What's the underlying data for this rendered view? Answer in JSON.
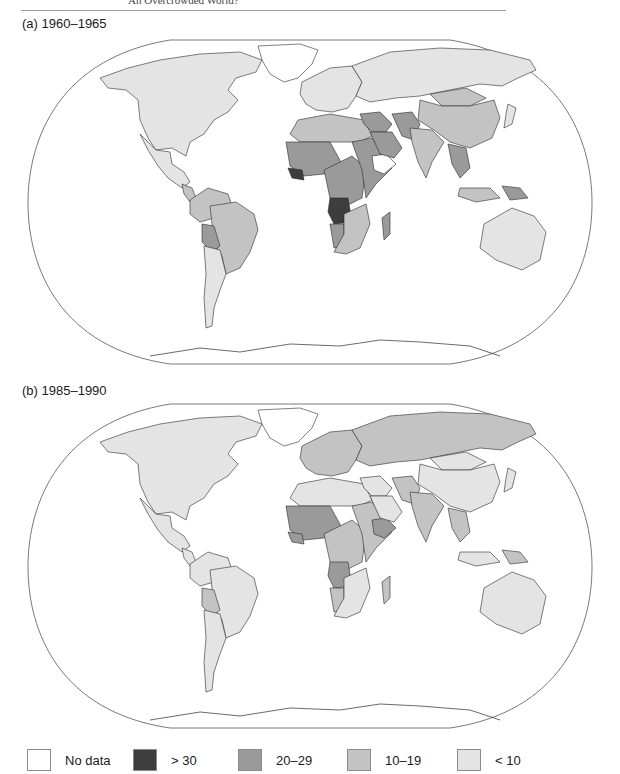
{
  "page": {
    "running_head": "An Overcrowded World?",
    "caption_a": "(a) 1960–1965",
    "caption_b": "(b) 1985–1990"
  },
  "colors": {
    "no_data": "#ffffff",
    "gt30": "#3d3d3d",
    "r20_29": "#9a9a9a",
    "r10_19": "#c3c3c3",
    "lt10": "#e4e4e4"
  },
  "legend": [
    {
      "label": "No data",
      "class": "no_data"
    },
    {
      "label": "> 30",
      "class": "gt30"
    },
    {
      "label": "20–29",
      "class": "r20_29"
    },
    {
      "label": "10–19",
      "class": "r10_19"
    },
    {
      "label": "< 10",
      "class": "lt10"
    }
  ],
  "chart_data": [
    {
      "type": "heatmap",
      "subtype": "choropleth-world-map",
      "title": "(a) 1960–1965",
      "legend": [
        "No data",
        "> 30",
        "20–29",
        "10–19",
        "< 10"
      ],
      "regions": {
        "north_america": "lt10",
        "greenland": "no_data",
        "mexico_central_america": "lt10",
        "central_america_south": "r10_19",
        "south_america_north": "r10_19",
        "brazil": "r10_19",
        "bolivia": "r20_29",
        "argentina": "lt10",
        "europe": "lt10",
        "soviet_union": "lt10",
        "north_africa": "r10_19",
        "west_africa_sahel": "r20_29",
        "sierra_leone_guinea": "gt30",
        "central_africa": "r20_29",
        "east_africa": "r20_29",
        "angola": "gt30",
        "southern_africa": "r10_19",
        "namibia": "r20_29",
        "madagascar": "r20_29",
        "middle_east": "r20_29",
        "arabia": "r20_29",
        "afghanistan_pakistan": "r20_29",
        "india": "r10_19",
        "china": "r10_19",
        "mongolia": "r10_19",
        "southeast_asia": "r20_29",
        "indonesia": "r10_19",
        "new_guinea": "r20_29",
        "australia": "lt10",
        "japan": "lt10"
      }
    },
    {
      "type": "heatmap",
      "subtype": "choropleth-world-map",
      "title": "(b) 1985–1990",
      "legend": [
        "No data",
        "> 30",
        "20–29",
        "10–19",
        "< 10"
      ],
      "regions": {
        "north_america": "lt10",
        "greenland": "no_data",
        "mexico_central_america": "lt10",
        "central_america_south": "lt10",
        "south_america_north": "lt10",
        "brazil": "lt10",
        "bolivia": "r10_19",
        "argentina": "lt10",
        "europe": "r10_19",
        "soviet_union": "r10_19",
        "north_africa": "lt10",
        "west_africa_sahel": "r20_29",
        "sierra_leone_guinea": "r20_29",
        "central_africa": "r10_19",
        "east_africa": "r10_19",
        "ethiopia": "r20_29",
        "angola": "r20_29",
        "southern_africa": "lt10",
        "namibia": "r10_19",
        "madagascar": "r10_19",
        "middle_east": "lt10",
        "arabia": "lt10",
        "afghanistan_pakistan": "r10_19",
        "india": "r10_19",
        "china": "lt10",
        "mongolia": "lt10",
        "southeast_asia": "r10_19",
        "indonesia": "lt10",
        "new_guinea": "r10_19",
        "australia": "lt10",
        "japan": "lt10"
      }
    }
  ]
}
